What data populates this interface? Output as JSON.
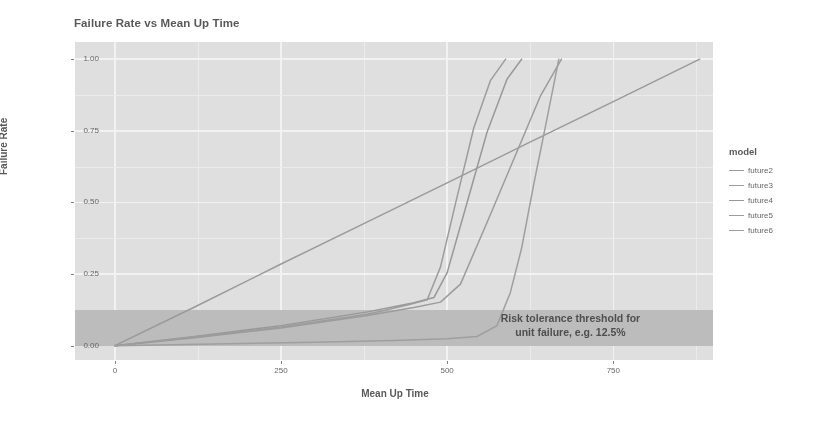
{
  "chart_data": {
    "type": "line",
    "title": "Failure Rate vs Mean Up Time",
    "xlabel": "Mean Up Time",
    "ylabel": "Failure Rate",
    "xlim": [
      -60,
      900
    ],
    "ylim": [
      -0.05,
      1.06
    ],
    "xticks": [
      0,
      250,
      500,
      750
    ],
    "xticklabels": [
      "0",
      "250",
      "500",
      "750"
    ],
    "yticks": [
      0.0,
      0.25,
      0.5,
      0.75,
      1.0
    ],
    "yticklabels": [
      "0.00",
      "0.25",
      "0.50",
      "0.75",
      "1.00"
    ],
    "grid": true,
    "grid_color": "#fbfbfb",
    "panel_background": "#e2e2e2",
    "legend_position": "right",
    "legend_title": "model",
    "annotations": [
      {
        "name": "risk-threshold-band",
        "text_line1": "Risk tolerance threshold for",
        "text_line2": "unit failure, e.g. 12.5%",
        "band_ymin": 0.0,
        "band_ymax": 0.125,
        "band_color": "#b6b6b6",
        "text_color": "#2f2f2f"
      }
    ],
    "series": [
      {
        "name": "future2",
        "color": "#8d8d8d",
        "x": [
          0,
          120,
          250,
          380,
          500,
          620,
          750,
          880
        ],
        "y": [
          0.0,
          0.135,
          0.285,
          0.432,
          0.568,
          0.705,
          0.852,
          1.0
        ]
      },
      {
        "name": "future3",
        "color": "#8f8f8f",
        "x": [
          0,
          120,
          250,
          380,
          450,
          490,
          520,
          560,
          600,
          640,
          672
        ],
        "y": [
          0.0,
          0.028,
          0.062,
          0.105,
          0.133,
          0.152,
          0.215,
          0.43,
          0.65,
          0.87,
          1.0
        ]
      },
      {
        "name": "future4",
        "color": "#8b8b8b",
        "x": [
          0,
          120,
          250,
          380,
          450,
          480,
          500,
          530,
          560,
          590,
          612
        ],
        "y": [
          0.0,
          0.032,
          0.07,
          0.118,
          0.15,
          0.168,
          0.255,
          0.5,
          0.745,
          0.93,
          1.0
        ]
      },
      {
        "name": "future5",
        "color": "#909090",
        "x": [
          0,
          120,
          250,
          380,
          440,
          470,
          490,
          515,
          540,
          565,
          588
        ],
        "y": [
          0.0,
          0.03,
          0.065,
          0.11,
          0.142,
          0.16,
          0.275,
          0.52,
          0.76,
          0.925,
          1.0
        ]
      },
      {
        "name": "future6",
        "color": "#939393",
        "x": [
          0,
          150,
          300,
          420,
          500,
          545,
          575,
          595,
          612,
          630,
          650,
          668
        ],
        "y": [
          0.0,
          0.006,
          0.012,
          0.018,
          0.024,
          0.032,
          0.07,
          0.185,
          0.34,
          0.56,
          0.79,
          1.0
        ]
      }
    ]
  },
  "legend": {
    "title": "model",
    "items": [
      {
        "label": "future2",
        "color": "#8d8d8d"
      },
      {
        "label": "future3",
        "color": "#8f8f8f"
      },
      {
        "label": "future4",
        "color": "#8b8b8b"
      },
      {
        "label": "future5",
        "color": "#909090"
      },
      {
        "label": "future6",
        "color": "#939393"
      }
    ]
  }
}
